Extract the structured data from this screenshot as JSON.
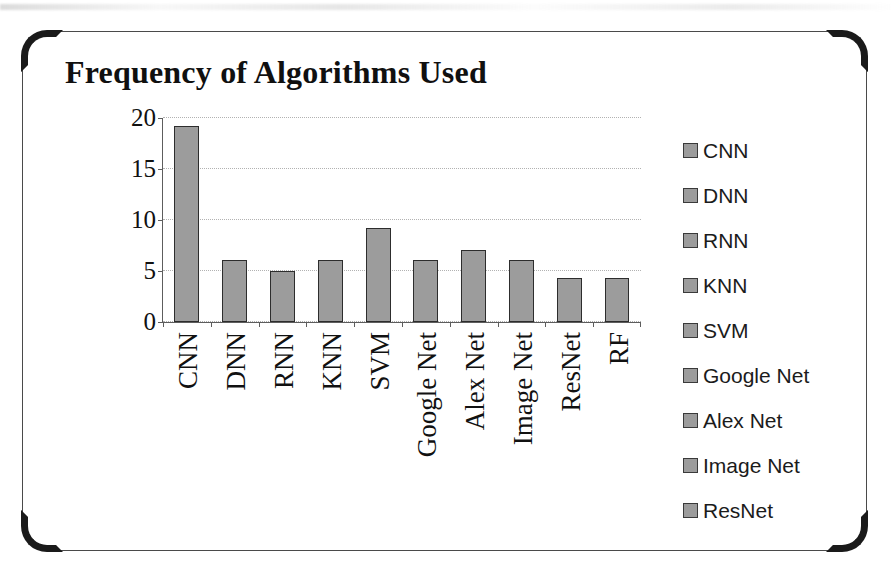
{
  "figure": {
    "frame_color": "#4a4a4a",
    "corner_accent_color": "#1a1a1a"
  },
  "chart_data": {
    "type": "bar",
    "title": "Frequency of Algorithms Used",
    "xlabel": "",
    "ylabel": "",
    "categories": [
      "CNN",
      "DNN",
      "RNN",
      "KNN",
      "SVM",
      "Google Net",
      "Alex Net",
      "Image Net",
      "ResNet",
      "RF"
    ],
    "values": [
      19.2,
      6.1,
      5.0,
      6.1,
      9.2,
      6.1,
      7.1,
      6.1,
      4.3,
      4.3
    ],
    "ylim": [
      0,
      20
    ],
    "yticks": [
      0,
      5,
      10,
      15,
      20
    ],
    "ytick_labels": [
      "0",
      "5",
      "10",
      "15",
      "20"
    ],
    "grid": true,
    "grid_axis": "y",
    "legend_position": "right",
    "legend": [
      "CNN",
      "DNN",
      "RNN",
      "KNN",
      "SVM",
      "Google Net",
      "Alex Net",
      "Image Net",
      "ResNet"
    ],
    "bar_color": "#9c9c9c",
    "bar_border_color": "#2d2d2d",
    "axis_color": "#5d5d5d",
    "gridline_color": "#b2b2b2"
  }
}
